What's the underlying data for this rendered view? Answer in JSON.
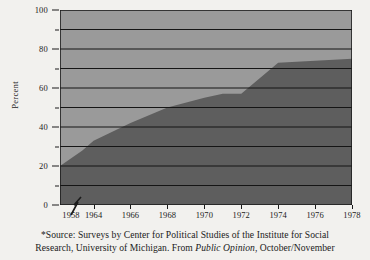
{
  "chart_data": {
    "type": "area",
    "title": "",
    "xlabel": "",
    "ylabel": "Percent",
    "xlim": [
      1958,
      1978
    ],
    "ylim": [
      0,
      100
    ],
    "grid": true,
    "legend": null,
    "axis_break": {
      "present": true,
      "between": [
        1958,
        1964
      ],
      "symbol": "zigzag"
    },
    "x": [
      1958,
      1960,
      1962,
      1964,
      1966,
      1968,
      1970,
      1971,
      1972,
      1973,
      1974,
      1976,
      1978
    ],
    "values": [
      20,
      24,
      28,
      33,
      42,
      50,
      55,
      57,
      57,
      65,
      73,
      74,
      75
    ],
    "series": [
      {
        "name": "Percent",
        "values": [
          20,
          24,
          28,
          33,
          42,
          50,
          55,
          57,
          57,
          65,
          73,
          74,
          75
        ]
      }
    ],
    "x_tick_labels": [
      "1958",
      "1964",
      "1966",
      "1968",
      "1970",
      "1972",
      "1974",
      "1976",
      "1978"
    ],
    "x_tick_values": [
      1958,
      1964,
      1966,
      1968,
      1970,
      1972,
      1974,
      1976,
      1978
    ],
    "y_tick_labels": [
      "0",
      "20",
      "40",
      "60",
      "80",
      "100"
    ],
    "y_tick_values": [
      0,
      20,
      40,
      60,
      80,
      100
    ],
    "y_minor_tick_values": [
      10,
      30,
      50,
      70,
      90
    ],
    "gridline_values": [
      10,
      20,
      30,
      40,
      50,
      60,
      70,
      80,
      90
    ],
    "colors": {
      "area_fill": "#5e5e5e",
      "plot_background": "#9a9a9a",
      "gridline": "#151515",
      "axis": "#1b1b1b",
      "page_background": "#f2f1ee",
      "text": "#1b1b1b"
    }
  },
  "footnote": {
    "line1": "*Source: Surveys by Center for Political Studies of the Institute for Social",
    "line2_part1": "Research, University of Michigan. From ",
    "line2_italic": "Public Opinion",
    "line2_part2": ", October/November"
  }
}
